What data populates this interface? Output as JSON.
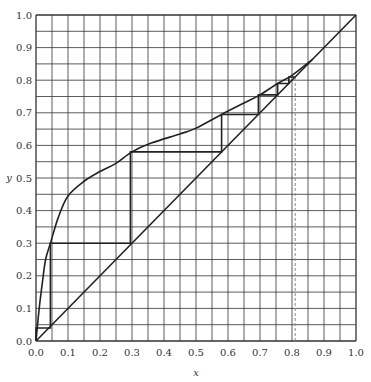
{
  "chart_data": {
    "type": "line",
    "title": "",
    "xlabel": "x",
    "ylabel": "y",
    "xlim": [
      0.0,
      1.0
    ],
    "ylim": [
      0.0,
      1.0
    ],
    "grid": true,
    "grid_step": 0.05,
    "x_ticks": [
      "0.0",
      "0.1",
      "0.2",
      "0.3",
      "0.4",
      "0.5",
      "0.6",
      "0.7",
      "0.8",
      "0.9",
      "1.0"
    ],
    "y_ticks": [
      "0.0",
      "0.1",
      "0.2",
      "0.3",
      "0.4",
      "0.5",
      "0.6",
      "0.7",
      "0.8",
      "0.9",
      "1.0"
    ],
    "series": [
      {
        "name": "equilibrium-curve",
        "x": [
          0.0,
          0.01,
          0.02,
          0.03,
          0.045,
          0.07,
          0.1,
          0.15,
          0.2,
          0.25,
          0.3,
          0.36,
          0.45,
          0.5,
          0.58,
          0.65,
          0.7,
          0.755,
          0.8,
          0.865
        ],
        "y": [
          0.0,
          0.1,
          0.18,
          0.25,
          0.3,
          0.38,
          0.445,
          0.49,
          0.52,
          0.545,
          0.58,
          0.607,
          0.635,
          0.653,
          0.695,
          0.73,
          0.755,
          0.79,
          0.815,
          0.865
        ]
      },
      {
        "name": "diagonal-y=x",
        "x": [
          0.0,
          1.0
        ],
        "y": [
          0.0,
          1.0
        ]
      },
      {
        "name": "stage-steps",
        "x": [
          0.0,
          0.0,
          0.045,
          0.045,
          0.295,
          0.295,
          0.58,
          0.58,
          0.695,
          0.695,
          0.755,
          0.755,
          0.79,
          0.79,
          0.81
        ],
        "y": [
          0.0,
          0.04,
          0.04,
          0.3,
          0.3,
          0.58,
          0.58,
          0.695,
          0.695,
          0.755,
          0.755,
          0.79,
          0.79,
          0.81,
          0.81
        ]
      },
      {
        "name": "dashed-marker",
        "style": "dashed",
        "x": [
          0.81,
          0.81
        ],
        "y": [
          0.0,
          0.81
        ]
      }
    ],
    "colors": {
      "line": "#222222",
      "grid": "#333333",
      "dashed": "#888888"
    }
  }
}
